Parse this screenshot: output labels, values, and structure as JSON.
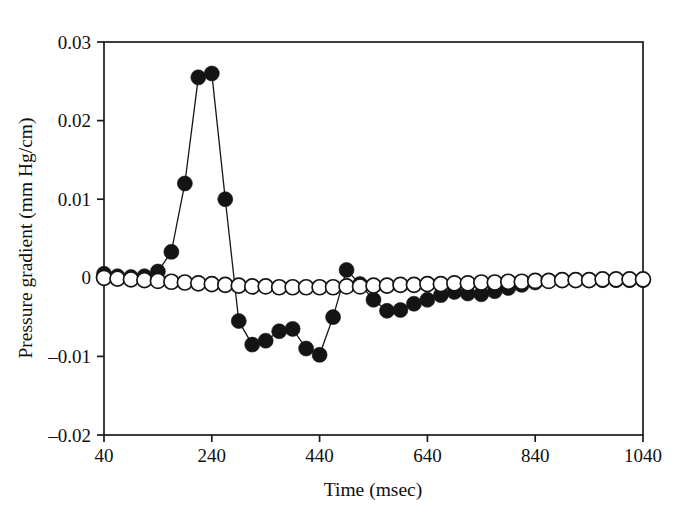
{
  "figure": {
    "background_color": "#ffffff",
    "foreground_color": "#141414"
  },
  "chart_data": {
    "type": "line",
    "title": "",
    "subtitle": "",
    "xlabel": "Time (msec)",
    "ylabel": "Pressure gradient (mm Hg/cm)",
    "xlim": [
      40,
      1040
    ],
    "ylim": [
      -0.02,
      0.03
    ],
    "xticks": [
      40,
      240,
      440,
      640,
      840,
      1040
    ],
    "xtick_labels": [
      "40",
      "240",
      "440",
      "640",
      "840",
      "1040"
    ],
    "yticks": [
      0.03,
      0.02,
      0.01,
      0,
      -0.01,
      -0.02
    ],
    "ytick_labels": [
      "0.03",
      "0.02",
      "0.01",
      "0",
      "-0.01",
      "-0.02"
    ],
    "grid": false,
    "legend": false,
    "legend_position": "none",
    "marker_radius_filled": 7.5,
    "marker_radius_open": 7.5,
    "series": [
      {
        "name": "filled-circles",
        "marker": "filled-circle",
        "color": "#141414",
        "x": [
          40,
          65,
          90,
          115,
          140,
          165,
          190,
          215,
          240,
          265,
          290,
          315,
          340,
          365,
          390,
          415,
          440,
          465,
          490,
          515,
          540,
          565,
          590,
          615,
          640,
          665,
          690,
          715,
          740,
          765,
          790,
          815,
          840,
          865,
          890,
          915,
          940,
          965,
          990,
          1015,
          1040
        ],
        "y": [
          0.0005,
          0.0002,
          0.0001,
          0.0002,
          0.0008,
          0.0033,
          0.012,
          0.0255,
          0.026,
          0.01,
          -0.0055,
          -0.0085,
          -0.008,
          -0.0068,
          -0.0065,
          -0.009,
          -0.0098,
          -0.005,
          0.001,
          -0.0008,
          -0.0028,
          -0.0042,
          -0.0041,
          -0.0033,
          -0.0028,
          -0.0022,
          -0.0018,
          -0.002,
          -0.0021,
          -0.0017,
          -0.0013,
          -0.0009,
          -0.0006,
          -0.0004,
          -0.0003,
          -0.0003,
          -0.0003,
          -0.0003,
          -0.0003,
          -0.0003,
          -0.0003
        ]
      },
      {
        "name": "open-circles",
        "marker": "open-circle",
        "color": "#141414",
        "x": [
          40,
          65,
          90,
          115,
          140,
          165,
          190,
          215,
          240,
          265,
          290,
          315,
          340,
          365,
          390,
          415,
          440,
          465,
          490,
          515,
          540,
          565,
          590,
          615,
          640,
          665,
          690,
          715,
          740,
          765,
          790,
          815,
          840,
          865,
          890,
          915,
          940,
          965,
          990,
          1015,
          1040
        ],
        "y": [
          0.0,
          -0.0001,
          -0.0002,
          -0.0003,
          -0.0004,
          -0.0005,
          -0.0006,
          -0.0007,
          -0.0008,
          -0.0009,
          -0.001,
          -0.0011,
          -0.0011,
          -0.0012,
          -0.0012,
          -0.0012,
          -0.0012,
          -0.0012,
          -0.0011,
          -0.0011,
          -0.001,
          -0.001,
          -0.0009,
          -0.0009,
          -0.0008,
          -0.0008,
          -0.0007,
          -0.0007,
          -0.0006,
          -0.0006,
          -0.0005,
          -0.0005,
          -0.0004,
          -0.0004,
          -0.0003,
          -0.0003,
          -0.0003,
          -0.0002,
          -0.0002,
          -0.0002,
          -0.0002
        ]
      }
    ]
  }
}
